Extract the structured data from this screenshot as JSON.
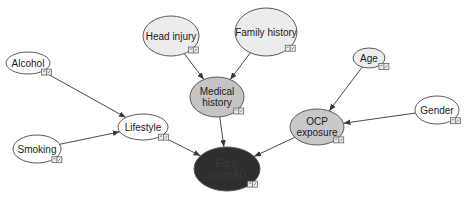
{
  "diagram": {
    "type": "bayesian-network",
    "colors": {
      "background": "#ffffff",
      "plain_node": "#ffffff",
      "intermediate_node": "#c8c8c8",
      "target_node": "#2e2e2e",
      "edge": "#4a4a4a"
    },
    "nodes": [
      {
        "id": "alcohol",
        "lines": [
          "Alcohol"
        ],
        "cx": 28,
        "cy": 63,
        "rx": 22,
        "ry": 11,
        "fill": "#ffffff",
        "text_color": "#1a1a1a"
      },
      {
        "id": "head_injury",
        "lines": [
          "Head injury"
        ],
        "cx": 171,
        "cy": 36,
        "rx": 28,
        "ry": 20,
        "fill": "#ececec",
        "text_color": "#1a1a1a"
      },
      {
        "id": "family_history",
        "lines": [
          "Family history"
        ],
        "cx": 266,
        "cy": 32,
        "rx": 31,
        "ry": 24,
        "fill": "#ececec",
        "text_color": "#1a1a1a"
      },
      {
        "id": "medical_history",
        "lines": [
          "Medical",
          "history"
        ],
        "cx": 217,
        "cy": 97,
        "rx": 27,
        "ry": 20,
        "fill": "#c4c4c4",
        "text_color": "#1a1a1a"
      },
      {
        "id": "age",
        "lines": [
          "Age"
        ],
        "cx": 369,
        "cy": 58,
        "rx": 16,
        "ry": 10,
        "fill": "#ececec",
        "text_color": "#1a1a1a"
      },
      {
        "id": "gender",
        "lines": [
          "Gender"
        ],
        "cx": 437,
        "cy": 110,
        "rx": 22,
        "ry": 14,
        "fill": "#ffffff",
        "text_color": "#1a1a1a"
      },
      {
        "id": "lifestyle",
        "lines": [
          "Lifestyle"
        ],
        "cx": 143,
        "cy": 127,
        "rx": 25,
        "ry": 13,
        "fill": "#ffffff",
        "text_color": "#1a1a1a"
      },
      {
        "id": "smoking",
        "lines": [
          "Smoking"
        ],
        "cx": 37,
        "cy": 149,
        "rx": 24,
        "ry": 14,
        "fill": "#ffffff",
        "text_color": "#1a1a1a"
      },
      {
        "id": "ocp_exposure",
        "lines": [
          "OCP",
          "exposure"
        ],
        "cx": 317,
        "cy": 127,
        "rx": 27,
        "ry": 18,
        "fill": "#c8c8c8",
        "text_color": "#1a1a1a"
      },
      {
        "id": "early_onset_ad",
        "lines": [
          "Early",
          "onsetAD"
        ],
        "cx": 227,
        "cy": 169,
        "rx": 33,
        "ry": 22,
        "fill": "#2e2e2e",
        "text_color": "#3a3a3a"
      }
    ],
    "edges": [
      {
        "from": "alcohol",
        "to": "lifestyle"
      },
      {
        "from": "smoking",
        "to": "lifestyle"
      },
      {
        "from": "head_injury",
        "to": "medical_history"
      },
      {
        "from": "family_history",
        "to": "medical_history"
      },
      {
        "from": "medical_history",
        "to": "early_onset_ad"
      },
      {
        "from": "lifestyle",
        "to": "early_onset_ad"
      },
      {
        "from": "age",
        "to": "ocp_exposure"
      },
      {
        "from": "gender",
        "to": "ocp_exposure"
      },
      {
        "from": "ocp_exposure",
        "to": "early_onset_ad"
      }
    ],
    "badge_icon": "monitor-toggle-icon"
  }
}
